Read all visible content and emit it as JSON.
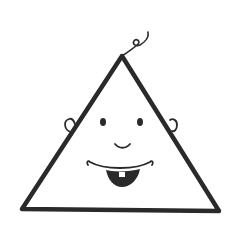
{
  "illustration": {
    "subject": "triangle baby face",
    "colors": {
      "ink": "#2a2a2a",
      "background": "#ffffff",
      "tooth": "#ffffff"
    },
    "parts": [
      "hair-curl",
      "triangle-head",
      "left-ear",
      "right-ear",
      "left-eye",
      "right-eye",
      "nose",
      "mouth",
      "tooth"
    ]
  }
}
